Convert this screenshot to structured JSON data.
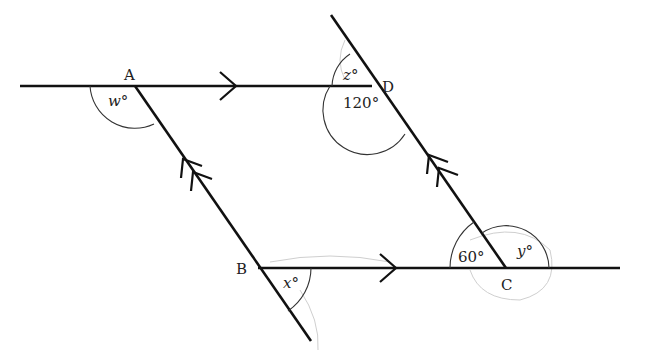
{
  "diagram": {
    "type": "parallelogram-angles",
    "points": {
      "A": "A",
      "B": "B",
      "C": "C",
      "D": "D"
    },
    "angles": {
      "w": "w°",
      "x": "x°",
      "y": "y°",
      "z": "z°",
      "d_lower": "120°",
      "c_left": "60°"
    },
    "markers": {
      "horizontal_parallel": "single-arrow",
      "slanted_parallel": "double-arrow"
    },
    "colors": {
      "line": "#111111",
      "background": "#ffffff"
    }
  }
}
